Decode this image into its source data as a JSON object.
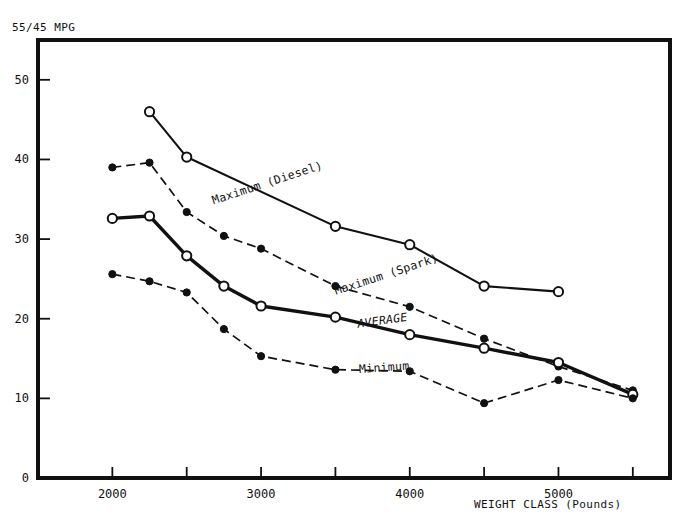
{
  "chart_data": {
    "type": "line",
    "title": "",
    "ylabel": "55/45 MPG",
    "xlabel": "WEIGHT CLASS  (Pounds)",
    "xlim": [
      1500,
      5750
    ],
    "ylim": [
      0,
      55
    ],
    "xticks": [
      2000,
      2500,
      3000,
      3500,
      4000,
      4500,
      5000,
      5500
    ],
    "xticklabels": [
      "2000",
      "",
      "3000",
      "",
      "4000",
      "",
      "5000",
      ""
    ],
    "yticks": [
      0,
      10,
      20,
      30,
      40,
      50
    ],
    "yticklabels": [
      "0",
      "10",
      "20",
      "30",
      "40",
      "50"
    ],
    "grid": false,
    "legend": "inline-annotations",
    "series": [
      {
        "name": "Maximum (Diesel)",
        "marker": "open-circle",
        "linestyle": "solid",
        "points": [
          {
            "x": 2250,
            "y": 46.0
          },
          {
            "x": 2500,
            "y": 40.3
          },
          {
            "x": 3500,
            "y": 31.6
          },
          {
            "x": 4000,
            "y": 29.3
          },
          {
            "x": 4500,
            "y": 24.1
          },
          {
            "x": 5000,
            "y": 23.4
          }
        ]
      },
      {
        "name": "Maximum (Spark)",
        "marker": "filled-circle",
        "linestyle": "dashed",
        "points": [
          {
            "x": 2000,
            "y": 39.0
          },
          {
            "x": 2250,
            "y": 39.6
          },
          {
            "x": 2500,
            "y": 33.4
          },
          {
            "x": 2750,
            "y": 30.4
          },
          {
            "x": 3000,
            "y": 28.8
          },
          {
            "x": 3500,
            "y": 24.1
          },
          {
            "x": 4000,
            "y": 21.5
          },
          {
            "x": 4500,
            "y": 17.5
          },
          {
            "x": 5000,
            "y": 14.0
          },
          {
            "x": 5500,
            "y": 11.0
          }
        ]
      },
      {
        "name": "AVERAGE",
        "marker": "open-circle",
        "linestyle": "solid-thick",
        "points": [
          {
            "x": 2000,
            "y": 32.6
          },
          {
            "x": 2250,
            "y": 32.9
          },
          {
            "x": 2500,
            "y": 27.9
          },
          {
            "x": 2750,
            "y": 24.1
          },
          {
            "x": 3000,
            "y": 21.6
          },
          {
            "x": 3500,
            "y": 20.2
          },
          {
            "x": 4000,
            "y": 18.0
          },
          {
            "x": 4500,
            "y": 16.3
          },
          {
            "x": 5000,
            "y": 14.5
          },
          {
            "x": 5500,
            "y": 10.5
          }
        ]
      },
      {
        "name": "Minimum",
        "marker": "filled-circle",
        "linestyle": "dashed",
        "points": [
          {
            "x": 2000,
            "y": 25.6
          },
          {
            "x": 2250,
            "y": 24.7
          },
          {
            "x": 2500,
            "y": 23.3
          },
          {
            "x": 2750,
            "y": 18.7
          },
          {
            "x": 3000,
            "y": 15.3
          },
          {
            "x": 3500,
            "y": 13.6
          },
          {
            "x": 4000,
            "y": 13.4
          },
          {
            "x": 4500,
            "y": 9.4
          },
          {
            "x": 5000,
            "y": 12.3
          },
          {
            "x": 5500,
            "y": 10.0
          }
        ]
      }
    ],
    "annotations": [
      {
        "text": "Maximum (Diesel)",
        "x": 3050,
        "y": 36.6,
        "rotation": -18,
        "style": "plain"
      },
      {
        "text": "Maximum (Spark)",
        "x": 3850,
        "y": 25.1,
        "rotation": -18,
        "style": "plain"
      },
      {
        "text": "AVERAGE",
        "x": 3820,
        "y": 19.3,
        "rotation": -8,
        "style": "italic"
      },
      {
        "text": "Minimum",
        "x": 3830,
        "y": 13.4,
        "rotation": -4,
        "style": "plain"
      }
    ]
  }
}
